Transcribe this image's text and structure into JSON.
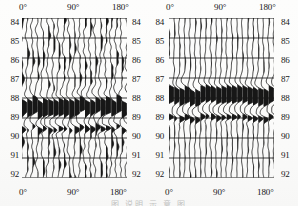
{
  "figure": {
    "background_color": "#fbfbfa",
    "ink_color": "#171717",
    "partial_caption": "图     说明   示 意 图"
  },
  "axes": {
    "x_tick_labels": [
      "0°",
      "90°",
      "180°"
    ],
    "x_tick_values": [
      0,
      90,
      180
    ],
    "x_min": 0,
    "x_max": 180,
    "y_tick_labels": [
      "84",
      "85",
      "86",
      "87",
      "88",
      "89",
      "90",
      "91",
      "92"
    ],
    "y_tick_values": [
      84,
      85,
      86,
      87,
      88,
      89,
      90,
      91,
      92
    ],
    "y_min": 84,
    "y_max": 92,
    "grid": "horizontal",
    "x_axis_position": "top-and-bottom",
    "y_axis_position": "left-and-right"
  },
  "chart_data": [
    {
      "type": "line",
      "name": "panel-left",
      "title": "",
      "xlabel": "",
      "ylabel": "",
      "xlim": [
        0,
        180
      ],
      "ylim": [
        84,
        92
      ],
      "grid": true,
      "legend": "none",
      "x_tick_labels": [
        "0°",
        "90°",
        "180°"
      ],
      "y_tick_labels": [
        "84",
        "85",
        "86",
        "87",
        "88",
        "89",
        "90",
        "91",
        "92"
      ],
      "trace_count": 21,
      "trace_azimuths": [
        0,
        9,
        18,
        27,
        36,
        45,
        54,
        63,
        72,
        81,
        90,
        99,
        108,
        117,
        126,
        135,
        144,
        153,
        162,
        171,
        180
      ],
      "plot_style": "variable-area wiggle, black fill on positive lobe",
      "high_amplitude_band": {
        "y_start": 87.4,
        "y_end": 89.3,
        "peak_y": 88.4,
        "description": "strong coherent arrival, heavily clipped black"
      },
      "secondary_band": {
        "y_start": 89.3,
        "y_end": 89.9,
        "peak_y": 89.5,
        "description": "weaker trailing arrival"
      },
      "trace_jitter": "moderate; traces show irregular small-amplitude wander between 84 and 87",
      "seed": 11
    },
    {
      "type": "line",
      "name": "panel-right",
      "title": "",
      "xlabel": "",
      "ylabel": "",
      "xlim": [
        0,
        180
      ],
      "ylim": [
        84,
        92
      ],
      "grid": true,
      "legend": "none",
      "x_tick_labels": [
        "0°",
        "90°",
        "180°"
      ],
      "y_tick_labels": [
        "84",
        "85",
        "86",
        "87",
        "88",
        "89",
        "90",
        "91",
        "92"
      ],
      "trace_count": 21,
      "trace_azimuths": [
        0,
        9,
        18,
        27,
        36,
        45,
        54,
        63,
        72,
        81,
        90,
        99,
        108,
        117,
        126,
        135,
        144,
        153,
        162,
        171,
        180
      ],
      "plot_style": "variable-area wiggle, black fill on positive lobe",
      "high_amplitude_band": {
        "y_start": 86.9,
        "y_end": 88.8,
        "peak_y": 87.9,
        "description": "strong coherent arrival, heavily clipped black"
      },
      "secondary_band": {
        "y_start": 88.8,
        "y_end": 89.4,
        "peak_y": 89.0,
        "description": "weaker trailing arrival"
      },
      "trace_jitter": "low; traces are straighter and more coherent than the left panel",
      "seed": 27
    }
  ],
  "panels": [
    {
      "id": "panel-left",
      "top_labels": [
        {
          "text": "0°",
          "x_pct": 0
        },
        {
          "text": "90°",
          "x_pct": 50
        },
        {
          "text": "180°",
          "x_pct": 100
        }
      ],
      "bottom_labels": [
        {
          "text": "0°",
          "x_pct": 0
        },
        {
          "text": "90°",
          "x_pct": 50
        },
        {
          "text": "180°",
          "x_pct": 100
        }
      ],
      "left_labels": [
        "84",
        "85",
        "86",
        "87",
        "88",
        "89",
        "90",
        "91",
        "92"
      ],
      "right_labels": [
        "84",
        "85",
        "86",
        "87",
        "88",
        "89",
        "90",
        "91",
        "92"
      ]
    },
    {
      "id": "panel-right",
      "top_labels": [
        {
          "text": "0°",
          "x_pct": 0
        },
        {
          "text": "90°",
          "x_pct": 50
        },
        {
          "text": "180°",
          "x_pct": 100
        }
      ],
      "bottom_labels": [
        {
          "text": "0°",
          "x_pct": 0
        },
        {
          "text": "90°",
          "x_pct": 50
        },
        {
          "text": "180°",
          "x_pct": 100
        }
      ],
      "left_labels": [
        "84",
        "85",
        "86",
        "87",
        "88",
        "89",
        "90",
        "91",
        "92"
      ],
      "right_labels": [
        "84",
        "85",
        "86",
        "87",
        "88",
        "89",
        "90",
        "91",
        "92"
      ]
    }
  ]
}
